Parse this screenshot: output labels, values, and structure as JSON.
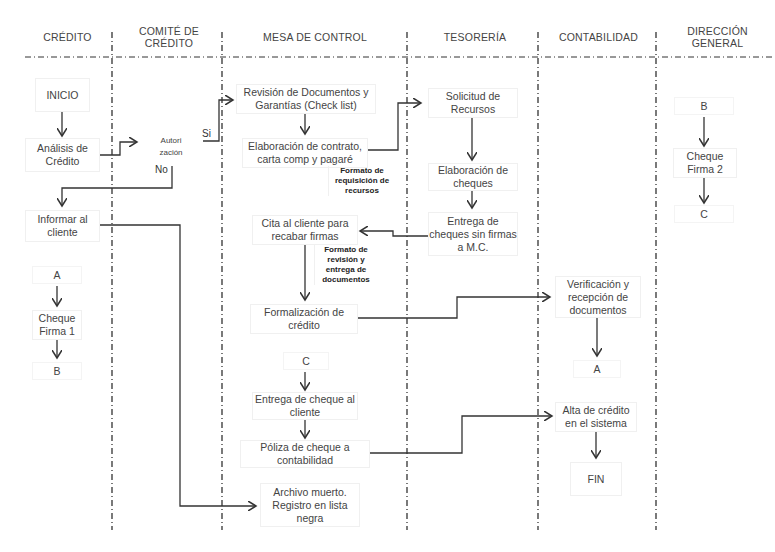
{
  "lanes": [
    {
      "id": "credito",
      "title": "CRÉDITO"
    },
    {
      "id": "comite",
      "title": "COMITÉ DE\nCRÉDITO"
    },
    {
      "id": "mesa",
      "title": "MESA DE CONTROL"
    },
    {
      "id": "tesoreria",
      "title": "TESORERÍA"
    },
    {
      "id": "contabilidad",
      "title": "CONTABILIDAD"
    },
    {
      "id": "direccion",
      "title": "DIRECCIÓN\nGENERAL"
    }
  ],
  "nodes": {
    "inicio": "INICIO",
    "analisis": "Análisis de Crédito",
    "autorizacion": "Autori zación",
    "informar": "Informar al cliente",
    "a_credito": "A",
    "cheque_firma1": "Cheque Firma 1",
    "b_credito": "B",
    "revision": "Revisión de Documentos y Garantías (Check list)",
    "elaboracion_contrato": "Elaboración de contrato, carta comp y pagaré",
    "cita_cliente": "Cita al cliente para recabar firmas",
    "formalizacion": "Formalización de crédito",
    "c_mesa": "C",
    "entrega_cheque": "Entrega de cheque al cliente",
    "poliza": "Póliza de cheque a contabilidad",
    "archivo": "Archivo muerto. Registro en lista negra",
    "solicitud": "Solicitud de Recursos",
    "elaboracion_cheques": "Elaboración de cheques",
    "entrega_cheques_sin_firma": "Entrega de cheques sin firmas a M.C.",
    "verificacion": "Verificación y recepción de documentos",
    "a_contab": "A",
    "alta": "Alta de crédito en el sistema",
    "fin": "FIN",
    "b_dir": "B",
    "cheque_firma2": "Cheque Firma 2",
    "c_dir": "C"
  },
  "notes": {
    "formato_requisicion": "Formato de requisición de recursos",
    "formato_revision": "Formato de revisión y entrega de documentos"
  },
  "decision_labels": {
    "si": "Si",
    "no": "No"
  }
}
